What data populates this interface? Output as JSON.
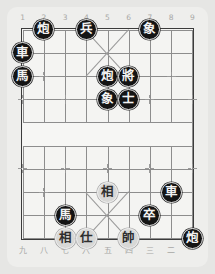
{
  "app": {
    "title": "Xiangqi Board",
    "background_color": "#e6e6e4",
    "panel_color": "#eeeeec",
    "board_color": "#f4f4f2",
    "line_color": "#8d8d8d",
    "border_color": "#3b3b3b",
    "black_piece_color": "#141414",
    "black_text_color": "#f2f2f2",
    "red_piece_color": "#d8d8d6",
    "red_text_color": "#2e2e2e",
    "label_color": "#a8a8a6"
  },
  "board": {
    "files": 9,
    "ranks": 10,
    "river_label": "",
    "top_labels": [
      "1",
      "2",
      "3",
      "4",
      "5",
      "6",
      "7",
      "8",
      "9"
    ],
    "bottom_labels": [
      "九",
      "八",
      "七",
      "六",
      "五",
      "四",
      "三",
      "二",
      "一"
    ]
  },
  "pieces": [
    {
      "name": "black-cannon-c2r0",
      "glyph": "炮",
      "side": "black",
      "file": 2,
      "rank": 0
    },
    {
      "name": "black-pawn-c4r0",
      "glyph": "兵",
      "side": "black",
      "file": 4,
      "rank": 0
    },
    {
      "name": "black-elephant-c7r0",
      "glyph": "象",
      "side": "black",
      "file": 7,
      "rank": 0
    },
    {
      "name": "black-chariot-c1r1",
      "glyph": "車",
      "side": "black",
      "file": 1,
      "rank": 1
    },
    {
      "name": "black-horse-c1r2",
      "glyph": "馬",
      "side": "black",
      "file": 1,
      "rank": 2
    },
    {
      "name": "black-cannon-c5r2",
      "glyph": "炮",
      "side": "black",
      "file": 5,
      "rank": 2
    },
    {
      "name": "black-general-c6r2",
      "glyph": "將",
      "side": "black",
      "file": 6,
      "rank": 2
    },
    {
      "name": "black-elephant-c5r3",
      "glyph": "象",
      "side": "black",
      "file": 5,
      "rank": 3
    },
    {
      "name": "black-advisor-c6r3",
      "glyph": "士",
      "side": "black",
      "file": 6,
      "rank": 3
    },
    {
      "name": "red-minister-c5r7",
      "glyph": "相",
      "side": "red",
      "file": 5,
      "rank": 7
    },
    {
      "name": "black-chariot-c8r7",
      "glyph": "車",
      "side": "black",
      "file": 8,
      "rank": 7
    },
    {
      "name": "black-horse-c3r8",
      "glyph": "馬",
      "side": "black",
      "file": 3,
      "rank": 8
    },
    {
      "name": "black-pawn-c7r8",
      "glyph": "卒",
      "side": "black",
      "file": 7,
      "rank": 8
    },
    {
      "name": "red-minister-c3r9",
      "glyph": "相",
      "side": "red",
      "file": 3,
      "rank": 9
    },
    {
      "name": "red-advisor-c4r9",
      "glyph": "仕",
      "side": "red",
      "file": 4,
      "rank": 9
    },
    {
      "name": "red-general-c6r9",
      "glyph": "帥",
      "side": "red",
      "file": 6,
      "rank": 9
    },
    {
      "name": "black-cannon-c9r9",
      "glyph": "炮",
      "side": "black",
      "file": 9,
      "rank": 9
    }
  ],
  "markers": [
    {
      "file": 2,
      "rank": 2
    },
    {
      "file": 8,
      "rank": 2
    },
    {
      "file": 1,
      "rank": 3
    },
    {
      "file": 3,
      "rank": 3
    },
    {
      "file": 5,
      "rank": 3
    },
    {
      "file": 7,
      "rank": 3
    },
    {
      "file": 9,
      "rank": 3
    },
    {
      "file": 1,
      "rank": 6
    },
    {
      "file": 3,
      "rank": 6
    },
    {
      "file": 5,
      "rank": 6
    },
    {
      "file": 7,
      "rank": 6
    },
    {
      "file": 9,
      "rank": 6
    },
    {
      "file": 2,
      "rank": 7
    },
    {
      "file": 8,
      "rank": 7
    }
  ]
}
